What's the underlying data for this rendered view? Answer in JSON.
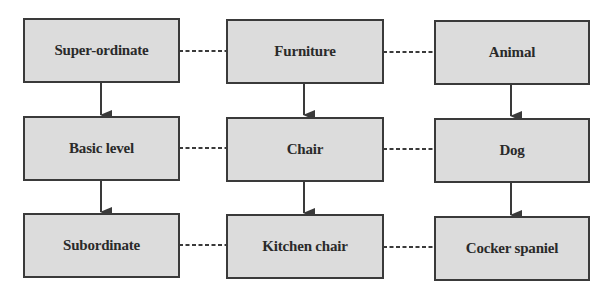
{
  "diagram": {
    "type": "category-hierarchy",
    "colors": {
      "box_fill": "#dcdcdc",
      "box_border": "#3a3a3a",
      "text": "#2a2a2a",
      "connector": "#3a3a3a"
    },
    "rows": [
      {
        "level": "super-ordinate",
        "nodes": [
          {
            "id": "super-ordinate",
            "label": "Super-ordinate"
          },
          {
            "id": "furniture",
            "label": "Furniture"
          },
          {
            "id": "animal",
            "label": "Animal"
          }
        ]
      },
      {
        "level": "basic",
        "nodes": [
          {
            "id": "basic-level",
            "label": "Basic level"
          },
          {
            "id": "chair",
            "label": "Chair"
          },
          {
            "id": "dog",
            "label": "Dog"
          }
        ]
      },
      {
        "level": "subordinate",
        "nodes": [
          {
            "id": "subordinate",
            "label": "Subordinate"
          },
          {
            "id": "kitchen-chair",
            "label": "Kitchen chair"
          },
          {
            "id": "cocker-spaniel",
            "label": "Cocker spaniel"
          }
        ]
      }
    ],
    "edges": [
      {
        "from": "super-ordinate",
        "to": "basic-level",
        "style": "arrow"
      },
      {
        "from": "furniture",
        "to": "chair",
        "style": "arrow"
      },
      {
        "from": "animal",
        "to": "dog",
        "style": "arrow"
      },
      {
        "from": "basic-level",
        "to": "subordinate",
        "style": "arrow"
      },
      {
        "from": "chair",
        "to": "kitchen-chair",
        "style": "arrow"
      },
      {
        "from": "dog",
        "to": "cocker-spaniel",
        "style": "arrow"
      },
      {
        "from": "super-ordinate",
        "to": "furniture",
        "style": "dotted"
      },
      {
        "from": "furniture",
        "to": "animal",
        "style": "dotted"
      },
      {
        "from": "basic-level",
        "to": "chair",
        "style": "dotted"
      },
      {
        "from": "chair",
        "to": "dog",
        "style": "dotted"
      },
      {
        "from": "subordinate",
        "to": "kitchen-chair",
        "style": "dotted"
      },
      {
        "from": "kitchen-chair",
        "to": "cocker-spaniel",
        "style": "dotted"
      }
    ]
  }
}
